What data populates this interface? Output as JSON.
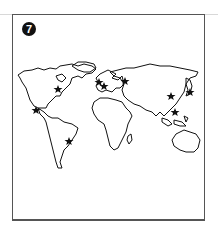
{
  "figure": {
    "number": "7",
    "border_color": "#555555",
    "line_color": "#111111"
  },
  "map": {
    "type": "world-outline",
    "markers": [
      {
        "id": "north-america-east",
        "x": 58,
        "y": 89
      },
      {
        "id": "mexico",
        "x": 36,
        "y": 110
      },
      {
        "id": "brazil",
        "x": 69,
        "y": 141
      },
      {
        "id": "western-europe-1",
        "x": 99,
        "y": 82
      },
      {
        "id": "western-europe-2",
        "x": 104,
        "y": 86
      },
      {
        "id": "eastern-europe",
        "x": 125,
        "y": 81
      },
      {
        "id": "china",
        "x": 171,
        "y": 96
      },
      {
        "id": "japan",
        "x": 190,
        "y": 92
      },
      {
        "id": "east-asia-south",
        "x": 175,
        "y": 112
      }
    ]
  }
}
